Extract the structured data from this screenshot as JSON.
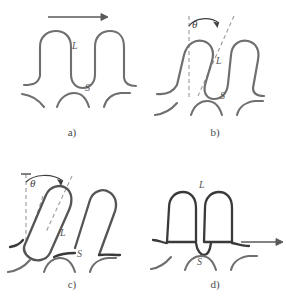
{
  "figure": {
    "type": "scientific-schematic",
    "background_color": "#ffffff",
    "stroke_color": "#6f6f6f",
    "stroke_color_dark": "#3a3a3a",
    "dash_color": "#9a9a9a",
    "arrow_color": "#5a5a5a"
  },
  "panels": [
    {
      "id": "a",
      "caption": "a)",
      "labels": {
        "loop": "L",
        "substrate": "S"
      },
      "annotations": {
        "arrow": "horizontal-right-arrow"
      },
      "state": "upright-loops"
    },
    {
      "id": "b",
      "caption": "b)",
      "labels": {
        "loop": "L",
        "substrate": "S"
      },
      "annotations": {
        "angle": "θ",
        "guides": "vertical-dashed and tilted-dashed"
      },
      "state": "slightly-tilted-loops"
    },
    {
      "id": "c",
      "caption": "c)",
      "labels": {
        "loop": "L",
        "substrate": "S"
      },
      "annotations": {
        "angle": "θ",
        "guides": "vertical-dashed and tilted-dashed"
      },
      "state": "strongly-tilted-elongated-loops"
    },
    {
      "id": "d",
      "caption": "d)",
      "labels": {
        "loop": "L",
        "substrate": "S"
      },
      "annotations": {
        "arrow": "horizontal-right-arrow"
      },
      "state": "upright-flattened-loops"
    }
  ]
}
